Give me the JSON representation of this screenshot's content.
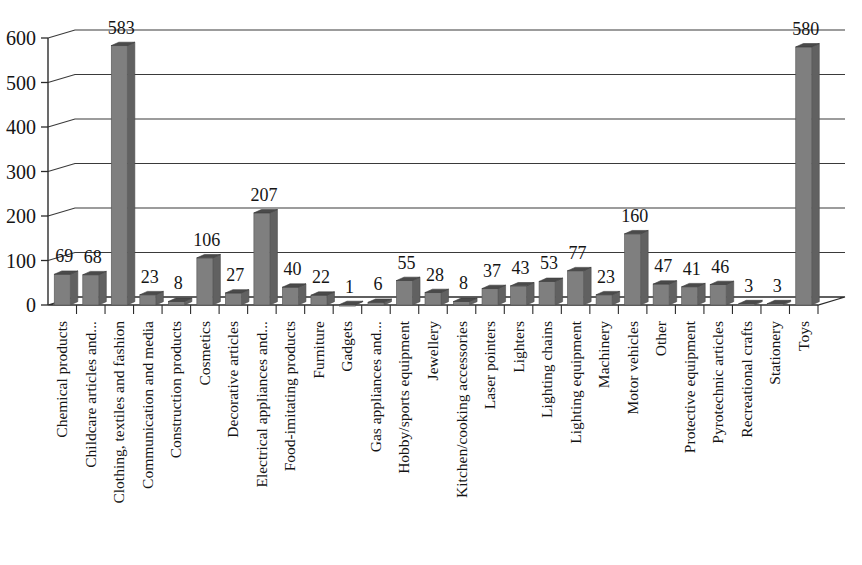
{
  "chart_data": {
    "type": "bar",
    "title": "",
    "subtitle": "",
    "xlabel": "",
    "ylabel": "",
    "ylim": [
      0,
      600
    ],
    "yticks": [
      0,
      100,
      200,
      300,
      400,
      500,
      600
    ],
    "ytick_labels": [
      "0",
      "100",
      "200",
      "300",
      "400",
      "500",
      "600"
    ],
    "grid": true,
    "grid_axis": "y",
    "legend": false,
    "legend_position": "none",
    "style": "3d-perspective-column",
    "bar_color": "#7f7f7f",
    "bar_top_color": "#4a4a4a",
    "bar_side_color": "#616161",
    "axis_color": "#2b2b2b",
    "text_color": "#151515",
    "background_color": "#ffffff",
    "data_labels": true,
    "category_label_rotation": -90,
    "categories": [
      "Chemical products",
      "Childcare articles and...",
      "Clothing, textiles and fashion",
      "Communication and media",
      "Construction products",
      "Cosmetics",
      "Decorative articles",
      "Electrical appliances and...",
      "Food-imitating products",
      "Furniture",
      "Gadgets",
      "Gas appliances and...",
      "Hobby/sports equipment",
      "Jewellery",
      "Kitchen/cooking accessories",
      "Laser pointers",
      "Lighters",
      "Lighting chains",
      "Lighting equipment",
      "Machinery",
      "Motor vehicles",
      "Other",
      "Protective equipment",
      "Pyrotechnic articles",
      "Recreational crafts",
      "Stationery",
      "Toys"
    ],
    "values": [
      69,
      68,
      583,
      23,
      8,
      106,
      27,
      207,
      40,
      22,
      1,
      6,
      55,
      28,
      8,
      37,
      43,
      53,
      77,
      23,
      160,
      47,
      41,
      46,
      3,
      3,
      580
    ],
    "value_labels": [
      "69",
      "68",
      "583",
      "23",
      "8",
      "106",
      "27",
      "207",
      "40",
      "22",
      "1",
      "6",
      "55",
      "28",
      "8",
      "37",
      "43",
      "53",
      "77",
      "23",
      "160",
      "47",
      "41",
      "46",
      "3",
      "3",
      "580"
    ]
  }
}
